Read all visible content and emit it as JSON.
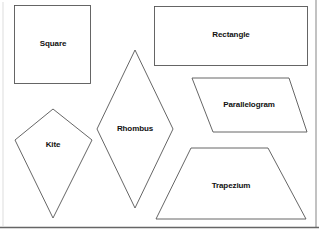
{
  "diagram": {
    "shapes": [
      {
        "name": "Square",
        "label": "Square"
      },
      {
        "name": "Rectangle",
        "label": "Rectangle"
      },
      {
        "name": "Parallelogram",
        "label": "Parallelogram"
      },
      {
        "name": "Rhombus",
        "label": "Rhombus"
      },
      {
        "name": "Kite",
        "label": "Kite"
      },
      {
        "name": "Trapezium",
        "label": "Trapezium"
      }
    ],
    "colors": {
      "stroke": "#555555",
      "fill": "#ffffff",
      "text": "#111111",
      "frame_right": "#999999",
      "frame_bottom": "#666666",
      "frame_left": "#dddddd"
    }
  }
}
